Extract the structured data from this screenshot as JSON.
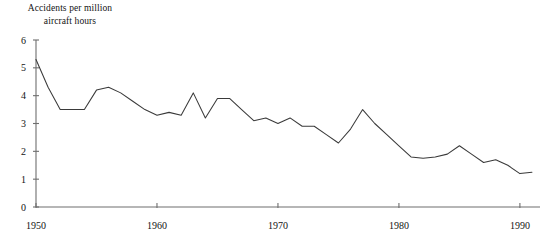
{
  "chart_data": {
    "type": "line",
    "title": "Accidents per million aircraft hours",
    "title_line1": "Accidents per million",
    "title_line2": "aircraft hours",
    "xlabel": "",
    "ylabel": "Accidents per million aircraft hours",
    "xlim": [
      1950,
      1991
    ],
    "ylim": [
      0,
      6
    ],
    "grid": false,
    "legend": false,
    "legend_position": "none",
    "x_ticks": [
      1950,
      1960,
      1970,
      1980,
      1990
    ],
    "x_tick_labels": [
      "1950",
      "1960",
      "1970",
      "1980",
      "1990"
    ],
    "y_ticks": [
      0,
      1,
      2,
      3,
      4,
      5,
      6
    ],
    "y_tick_labels": [
      "0",
      "1",
      "2",
      "3",
      "4",
      "5",
      "6"
    ],
    "line_color": "#3a3a3a",
    "axis_color": "#6e6e6e",
    "series": [
      {
        "name": "Accident rate",
        "x": [
          1950,
          1951,
          1952,
          1953,
          1954,
          1955,
          1956,
          1957,
          1958,
          1959,
          1960,
          1961,
          1962,
          1963,
          1964,
          1965,
          1966,
          1967,
          1968,
          1969,
          1970,
          1971,
          1972,
          1973,
          1974,
          1975,
          1976,
          1977,
          1978,
          1979,
          1980,
          1981,
          1982,
          1983,
          1984,
          1985,
          1986,
          1987,
          1988,
          1989,
          1990,
          1991
        ],
        "values": [
          5.3,
          4.3,
          3.5,
          3.5,
          3.5,
          4.2,
          4.3,
          4.1,
          3.8,
          3.5,
          3.3,
          3.4,
          3.3,
          4.1,
          3.2,
          3.9,
          3.9,
          3.5,
          3.1,
          3.2,
          3.0,
          3.2,
          2.9,
          2.9,
          2.6,
          2.3,
          2.8,
          3.5,
          3.0,
          2.6,
          2.2,
          1.8,
          1.75,
          1.8,
          1.9,
          2.2,
          1.9,
          1.6,
          1.7,
          1.5,
          1.2,
          1.25
        ]
      }
    ]
  }
}
